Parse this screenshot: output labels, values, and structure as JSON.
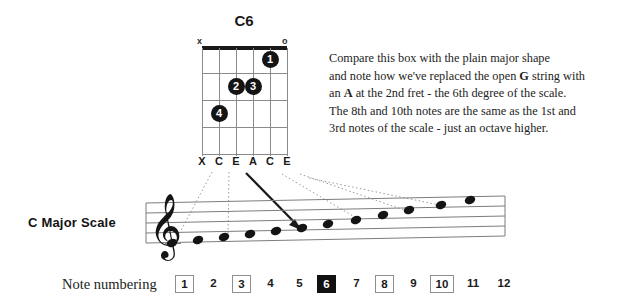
{
  "chord": {
    "name": "C6",
    "open_markers": [
      {
        "symbol": "x",
        "string": 6
      },
      {
        "symbol": "o",
        "string": 1
      }
    ],
    "strings": 6,
    "frets": 4,
    "fingerings": [
      {
        "finger": "1",
        "string": 2,
        "fret": 1
      },
      {
        "finger": "2",
        "string": 4,
        "fret": 2
      },
      {
        "finger": "3",
        "string": 3,
        "fret": 2
      },
      {
        "finger": "4",
        "string": 5,
        "fret": 3
      }
    ],
    "note_letters": [
      "X",
      "C",
      "E",
      "A",
      "C",
      "E"
    ]
  },
  "description": {
    "line1_a": "Compare this box with the plain major shape",
    "line2_a": "and note how we've replaced the open ",
    "line2_b": "G",
    "line2_c": " string with",
    "line3_a": "an ",
    "line3_b": "A",
    "line3_c": " at the 2nd fret - the 6th degree of the scale.",
    "line4_a": "The 8th and 10th notes are the same as the 1st and",
    "line5_a": "3rd notes of the scale - just an octave higher."
  },
  "staff": {
    "label": "C Major Scale",
    "clef": "treble-clef",
    "notes": [
      {
        "index": 1,
        "name": "C",
        "x": 172,
        "y": 243
      },
      {
        "index": 2,
        "name": "D",
        "x": 198,
        "y": 240
      },
      {
        "index": 3,
        "name": "E",
        "x": 224,
        "y": 238
      },
      {
        "index": 4,
        "name": "F",
        "x": 250,
        "y": 235
      },
      {
        "index": 5,
        "name": "G",
        "x": 276,
        "y": 232
      },
      {
        "index": 6,
        "name": "A",
        "x": 302,
        "y": 229
      },
      {
        "index": 7,
        "name": "B",
        "x": 328,
        "y": 226
      },
      {
        "index": 8,
        "name": "C",
        "x": 354,
        "y": 222
      },
      {
        "index": 9,
        "name": "D",
        "x": 380,
        "y": 219
      },
      {
        "index": 10,
        "name": "E",
        "x": 406,
        "y": 215
      },
      {
        "index": 11,
        "name": "F",
        "x": 440,
        "y": 208
      },
      {
        "index": 12,
        "name": "G",
        "x": 470,
        "y": 204
      }
    ]
  },
  "numbering": {
    "label": "Note numbering",
    "cells": [
      {
        "value": "1",
        "style": "boxed"
      },
      {
        "value": "2",
        "style": "plain"
      },
      {
        "value": "3",
        "style": "boxed"
      },
      {
        "value": "4",
        "style": "plain"
      },
      {
        "value": "5",
        "style": "plain"
      },
      {
        "value": "6",
        "style": "filled"
      },
      {
        "value": "7",
        "style": "plain"
      },
      {
        "value": "8",
        "style": "boxed"
      },
      {
        "value": "9",
        "style": "plain"
      },
      {
        "value": "10",
        "style": "boxed"
      },
      {
        "value": "11",
        "style": "plain"
      },
      {
        "value": "12",
        "style": "plain"
      }
    ]
  },
  "colors": {
    "ink": "#141414",
    "grid": "#8a8a8a",
    "highlight": "#111111",
    "background": "#ffffff"
  }
}
